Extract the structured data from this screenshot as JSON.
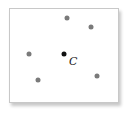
{
  "diagram": {
    "center": {
      "label": "C",
      "x": 64,
      "y": 54,
      "color": "#111111"
    },
    "points": [
      {
        "x": 67,
        "y": 18,
        "color": "#7a7a7a"
      },
      {
        "x": 91,
        "y": 27,
        "color": "#7a7a7a"
      },
      {
        "x": 29,
        "y": 54,
        "color": "#7a7a7a"
      },
      {
        "x": 38,
        "y": 80,
        "color": "#7a7a7a"
      },
      {
        "x": 97,
        "y": 76,
        "color": "#7a7a7a"
      }
    ]
  }
}
